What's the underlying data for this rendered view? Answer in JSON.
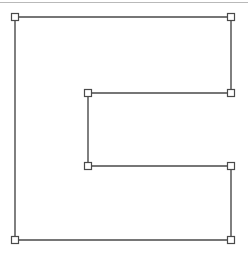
{
  "canvas": {
    "width": 248,
    "height": 255,
    "background_color": "#ffffff",
    "title": "Shape Diagram"
  },
  "separator": {
    "name": "top-horizontal-rule",
    "y": 2,
    "x_start": 0,
    "x_end": 248,
    "color": "#b9b9b9",
    "thickness": 1
  },
  "shape": {
    "name": "c-shaped-polygon",
    "description": "Rectangle with a rectangular notch cut out of the right-middle edge, forming a C shape",
    "stroke_color": "#4a4a4a",
    "fill_color": "#ffffff",
    "stroke_width": 1.4,
    "points_path": "15,17 231,17 231,93 88,93 88,166 231,166 231,240 15,240",
    "vertices": [
      {
        "label": "top-left",
        "x": 15,
        "y": 17
      },
      {
        "label": "top-right",
        "x": 231,
        "y": 17
      },
      {
        "label": "notch-upper-right",
        "x": 231,
        "y": 93
      },
      {
        "label": "notch-upper-left",
        "x": 88,
        "y": 93
      },
      {
        "label": "notch-lower-left",
        "x": 88,
        "y": 166
      },
      {
        "label": "notch-lower-right",
        "x": 231,
        "y": 166
      },
      {
        "label": "bottom-right",
        "x": 231,
        "y": 240
      },
      {
        "label": "bottom-left",
        "x": 15,
        "y": 240
      }
    ],
    "marker": {
      "name": "vertex-square-marker",
      "shape": "square",
      "size": 7,
      "fill_color": "#ffffff",
      "stroke_color": "#4a4a4a",
      "stroke_width": 1.2
    }
  }
}
